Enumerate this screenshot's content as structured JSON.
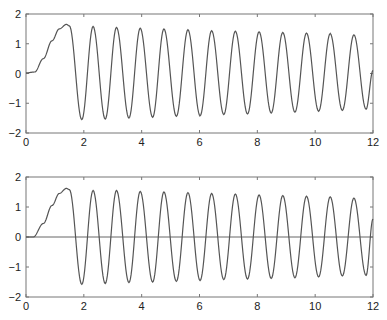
{
  "chart_data": [
    {
      "type": "line",
      "title": "",
      "xlabel": "",
      "ylabel": "",
      "xlim": [
        0,
        12
      ],
      "ylim": [
        -2,
        2
      ],
      "xticks": [
        0,
        2,
        4,
        6,
        8,
        10,
        12
      ],
      "yticks": [
        -2,
        -1,
        0,
        1,
        2
      ],
      "grid": false,
      "zero_line": false,
      "series": [
        {
          "name": "signal",
          "color": "#555555",
          "points": [
            [
              0,
              0.02
            ],
            [
              0.3,
              0.05
            ],
            [
              0.6,
              0.5
            ],
            [
              0.9,
              1.1
            ],
            [
              1.15,
              1.5
            ],
            [
              1.4,
              1.65
            ],
            [
              1.5,
              1.6
            ],
            [
              1.93,
              -1.55
            ],
            [
              2.32,
              1.58
            ],
            [
              2.74,
              -1.53
            ],
            [
              3.13,
              1.55
            ],
            [
              3.56,
              -1.5
            ],
            [
              3.95,
              1.52
            ],
            [
              4.38,
              -1.47
            ],
            [
              4.77,
              1.5
            ],
            [
              5.2,
              -1.44
            ],
            [
              5.6,
              1.47
            ],
            [
              6.02,
              -1.42
            ],
            [
              6.42,
              1.44
            ],
            [
              6.84,
              -1.38
            ],
            [
              7.24,
              1.42
            ],
            [
              7.66,
              -1.36
            ],
            [
              8.06,
              1.4
            ],
            [
              8.48,
              -1.33
            ],
            [
              8.88,
              1.38
            ],
            [
              9.3,
              -1.3
            ],
            [
              9.7,
              1.36
            ],
            [
              10.12,
              -1.27
            ],
            [
              10.52,
              1.34
            ],
            [
              10.94,
              -1.24
            ],
            [
              11.34,
              1.3
            ],
            [
              11.76,
              -1.2
            ],
            [
              12,
              0.1
            ]
          ]
        }
      ]
    },
    {
      "type": "line",
      "title": "",
      "xlabel": "",
      "ylabel": "",
      "xlim": [
        0,
        12
      ],
      "ylim": [
        -2,
        2
      ],
      "xticks": [
        0,
        2,
        4,
        6,
        8,
        10,
        12
      ],
      "yticks": [
        -2,
        -1,
        0,
        1,
        2
      ],
      "grid": false,
      "zero_line": true,
      "series": [
        {
          "name": "signal",
          "color": "#555555",
          "points": [
            [
              0,
              0
            ],
            [
              0.25,
              0.0
            ],
            [
              0.6,
              0.45
            ],
            [
              0.9,
              1.05
            ],
            [
              1.15,
              1.45
            ],
            [
              1.4,
              1.62
            ],
            [
              1.5,
              1.58
            ],
            [
              1.93,
              -1.58
            ],
            [
              2.32,
              1.55
            ],
            [
              2.74,
              -1.55
            ],
            [
              3.13,
              1.55
            ],
            [
              3.56,
              -1.52
            ],
            [
              3.95,
              1.52
            ],
            [
              4.38,
              -1.5
            ],
            [
              4.77,
              1.5
            ],
            [
              5.2,
              -1.48
            ],
            [
              5.6,
              1.48
            ],
            [
              6.02,
              -1.45
            ],
            [
              6.42,
              1.45
            ],
            [
              6.84,
              -1.42
            ],
            [
              7.24,
              1.43
            ],
            [
              7.66,
              -1.4
            ],
            [
              8.06,
              1.4
            ],
            [
              8.48,
              -1.38
            ],
            [
              8.88,
              1.38
            ],
            [
              9.3,
              -1.36
            ],
            [
              9.7,
              1.36
            ],
            [
              10.12,
              -1.33
            ],
            [
              10.52,
              1.34
            ],
            [
              10.94,
              -1.3
            ],
            [
              11.34,
              1.3
            ],
            [
              11.76,
              -1.28
            ],
            [
              12,
              0.6
            ]
          ]
        }
      ]
    }
  ]
}
